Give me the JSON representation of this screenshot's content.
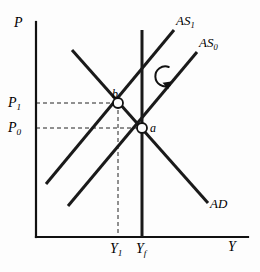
{
  "figure": {
    "type": "economics-diagram",
    "background_color": "#fdfdfd",
    "line_color": "#1a1a1a",
    "dash_color": "#1a1a1a"
  },
  "axes": {
    "y_axis_label": "P",
    "x_axis_label": "Y",
    "origin": {
      "x": 36,
      "y": 237
    },
    "y_axis_top": 22,
    "x_axis_right": 248
  },
  "tick_labels": {
    "price": [
      {
        "name": "P1",
        "base": "P",
        "sub": "1",
        "value_y": 103
      },
      {
        "name": "P0",
        "base": "P",
        "sub": "0",
        "value_y": 128
      }
    ],
    "output": [
      {
        "name": "Y1",
        "base": "Y",
        "sub": "1",
        "value_x": 118
      },
      {
        "name": "Yf",
        "base": "Y",
        "sub": "f",
        "value_x": 142
      }
    ]
  },
  "curves": [
    {
      "name": "AS1",
      "label_base": "AS",
      "label_sub": "1",
      "kind": "upward-sloping",
      "x1": 46,
      "y1": 184,
      "x2": 174,
      "y2": 30
    },
    {
      "name": "AS0",
      "label_base": "AS",
      "label_sub": "0",
      "kind": "upward-sloping",
      "x1": 68,
      "y1": 206,
      "x2": 197,
      "y2": 52
    },
    {
      "name": "AD",
      "label_base": "AD",
      "label_sub": "",
      "kind": "downward-sloping",
      "x1": 72,
      "y1": 50,
      "x2": 208,
      "y2": 203
    },
    {
      "name": "Yf-vertical",
      "label_base": "",
      "label_sub": "",
      "kind": "vertical-potential-output",
      "x1": 142,
      "y1": 30,
      "x2": 142,
      "y2": 237
    }
  ],
  "points": [
    {
      "name": "a",
      "label": "a",
      "x": 142,
      "y": 128
    },
    {
      "name": "b",
      "label": "b",
      "x": 118,
      "y": 103
    }
  ],
  "annotations": {
    "rotation_arrow": {
      "name": "clockwise-shift-arrow",
      "glyph": "clockwise-circular-arrow",
      "cx": 173,
      "cy": 76,
      "r": 10
    }
  },
  "guide_lines": [
    {
      "name": "p1-guide",
      "from_x": 36,
      "to_x": 118,
      "y": 103
    },
    {
      "name": "p0-guide",
      "from_x": 36,
      "to_x": 142,
      "y": 128
    },
    {
      "name": "y1-guide",
      "x": 118,
      "from_y": 103,
      "to_y": 237
    }
  ]
}
